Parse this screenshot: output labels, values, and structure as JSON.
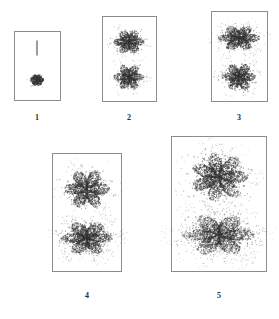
{
  "figure": {
    "title": "",
    "background_color": "#ffffff",
    "ink_color": "#3a3a3a",
    "border_color": "#8c8c8c",
    "panel_count": 5
  },
  "chart_data": {
    "type": "scatter",
    "title": "",
    "xlabel": "",
    "ylabel": "",
    "grid": false,
    "legend": false,
    "panels": [
      {
        "label": "1",
        "frame": {
          "x": 14,
          "y": 31,
          "w": 47,
          "h": 70
        },
        "features": [
          {
            "kind": "vertical-line",
            "cx": 37,
            "cy": 48,
            "w": 1,
            "h": 15,
            "intensity": 1.0
          },
          {
            "kind": "speckle-blob",
            "cx": 37,
            "cy": 80,
            "rx": 7,
            "ry": 6,
            "points": 6,
            "spread": 0.18,
            "density": 380,
            "dot": 0.85,
            "intensity": 0.95,
            "shape": "compact"
          }
        ]
      },
      {
        "label": "2",
        "frame": {
          "x": 102,
          "y": 16,
          "w": 55,
          "h": 86
        },
        "features": [
          {
            "kind": "speckle-blob",
            "cx": 129,
            "cy": 42,
            "rx": 16,
            "ry": 13,
            "points": 6,
            "spread": 0.34,
            "density": 900,
            "dot": 0.8,
            "intensity": 0.9,
            "shape": "diamond"
          },
          {
            "kind": "speckle-blob",
            "cx": 129,
            "cy": 77,
            "rx": 16,
            "ry": 14,
            "points": 6,
            "spread": 0.36,
            "density": 900,
            "dot": 0.8,
            "intensity": 0.9,
            "shape": "star"
          }
        ]
      },
      {
        "label": "3",
        "frame": {
          "x": 211,
          "y": 11,
          "w": 57,
          "h": 91
        },
        "features": [
          {
            "kind": "speckle-blob",
            "cx": 239,
            "cy": 38,
            "rx": 22,
            "ry": 14,
            "points": 6,
            "spread": 0.42,
            "density": 1250,
            "dot": 0.8,
            "intensity": 0.88,
            "shape": "wide"
          },
          {
            "kind": "speckle-blob",
            "cx": 239,
            "cy": 77,
            "rx": 18,
            "ry": 15,
            "points": 6,
            "spread": 0.4,
            "density": 1050,
            "dot": 0.8,
            "intensity": 0.9,
            "shape": "star"
          }
        ]
      },
      {
        "label": "4",
        "frame": {
          "x": 52,
          "y": 153,
          "w": 70,
          "h": 119
        },
        "features": [
          {
            "kind": "speckle-blob",
            "cx": 87,
            "cy": 189,
            "rx": 24,
            "ry": 22,
            "points": 6,
            "spread": 0.46,
            "density": 1600,
            "dot": 0.8,
            "intensity": 0.85,
            "shape": "star"
          },
          {
            "kind": "speckle-blob",
            "cx": 87,
            "cy": 238,
            "rx": 28,
            "ry": 19,
            "points": 6,
            "spread": 0.62,
            "density": 1900,
            "dot": 0.8,
            "intensity": 0.8,
            "shape": "diffuse-wide"
          }
        ]
      },
      {
        "label": "5",
        "frame": {
          "x": 171,
          "y": 136,
          "w": 96,
          "h": 136
        },
        "features": [
          {
            "kind": "speckle-blob",
            "cx": 219,
            "cy": 177,
            "rx": 31,
            "ry": 27,
            "points": 7,
            "spread": 0.52,
            "density": 2300,
            "dot": 0.8,
            "intensity": 0.82,
            "shape": "star"
          },
          {
            "kind": "speckle-blob",
            "cx": 219,
            "cy": 235,
            "rx": 40,
            "ry": 24,
            "points": 6,
            "spread": 0.78,
            "density": 2600,
            "dot": 0.8,
            "intensity": 0.72,
            "shape": "diffuse-wide"
          }
        ]
      }
    ],
    "labels": [
      {
        "text": "1",
        "x": 37,
        "y": 118
      },
      {
        "text": "2",
        "x": 129,
        "y": 118
      },
      {
        "text": "3",
        "x": 239,
        "y": 118
      },
      {
        "text": "4",
        "x": 87,
        "y": 296
      },
      {
        "text": "5",
        "x": 219,
        "y": 296
      }
    ]
  }
}
